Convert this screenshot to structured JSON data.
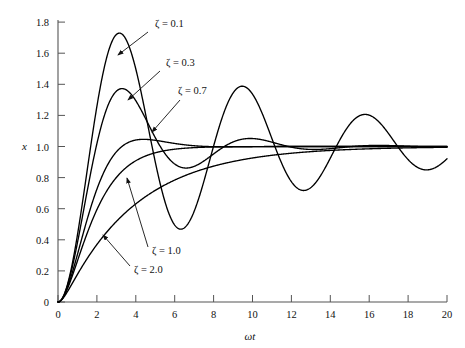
{
  "chart_data": {
    "type": "line",
    "title": "",
    "xlabel": "ωt",
    "ylabel": "x",
    "xlim": [
      0,
      20
    ],
    "ylim": [
      0,
      1.9
    ],
    "grid": false,
    "legend_position": "inline-annotations",
    "xticks": [
      0,
      2,
      4,
      6,
      8,
      10,
      12,
      14,
      16,
      18,
      20
    ],
    "xtick_labels": [
      "0",
      "2",
      "4",
      "6",
      "8",
      "10",
      "12",
      "14",
      "16",
      "18",
      "20"
    ],
    "yticks": [
      0,
      0.2,
      0.4,
      0.6,
      0.8,
      1.0,
      1.2,
      1.4,
      1.6,
      1.8
    ],
    "ytick_labels": [
      "0",
      "0.2",
      "0.4",
      "0.6",
      "0.8",
      "1.0",
      "1.2",
      "1.4",
      "1.6",
      "1.8"
    ],
    "series": [
      {
        "name": "ζ = 0.1",
        "zeta": 0.1,
        "color": "#000000",
        "peak_value": 1.73,
        "peak_x": 3.2,
        "annotation": {
          "label": "ζ = 0.1",
          "text_x": 155,
          "text_y": 27,
          "line_from_x": 148,
          "line_from_y": 32,
          "arrow_to_x": 118,
          "arrow_to_y": 55
        }
      },
      {
        "name": "ζ = 0.3",
        "zeta": 0.3,
        "color": "#000000",
        "peak_value": 1.37,
        "peak_x": 3.3,
        "annotation": {
          "label": "ζ = 0.3",
          "text_x": 166,
          "text_y": 66,
          "line_from_x": 160,
          "line_from_y": 71,
          "arrow_to_x": 128,
          "arrow_to_y": 100
        }
      },
      {
        "name": "ζ = 0.7",
        "zeta": 0.7,
        "color": "#000000",
        "peak_value": 1.05,
        "peak_x": 4.5,
        "annotation": {
          "label": "ζ = 0.7",
          "text_x": 178,
          "text_y": 94,
          "line_from_x": 180,
          "line_from_y": 100,
          "arrow_to_x": 152,
          "arrow_to_y": 132
        }
      },
      {
        "name": "ζ = 1.0",
        "zeta": 1.0,
        "color": "#000000",
        "peak_value": 1.0,
        "peak_x": 20,
        "annotation": {
          "label": "ζ = 1.0",
          "text_x": 152,
          "text_y": 254,
          "line_from_x": 148,
          "line_from_y": 247,
          "arrow_to_x": 127,
          "arrow_to_y": 178
        }
      },
      {
        "name": "ζ = 2.0",
        "zeta": 2.0,
        "color": "#000000",
        "peak_value": 1.0,
        "peak_x": 20,
        "annotation": {
          "label": "ζ = 2.0",
          "text_x": 134,
          "text_y": 273,
          "line_from_x": 130,
          "line_from_y": 266,
          "arrow_to_x": 103,
          "arrow_to_y": 235
        }
      }
    ]
  },
  "labels": {
    "y_axis": "x",
    "x_axis": "ωt"
  }
}
